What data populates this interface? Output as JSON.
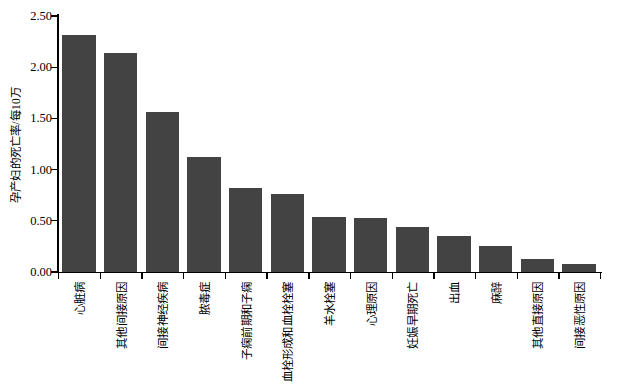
{
  "chart_data": {
    "type": "bar",
    "title": "",
    "subtitle": "",
    "xlabel": "",
    "ylabel": "孕产妇的死亡率/每10万",
    "ylim": [
      0.0,
      2.5
    ],
    "yticks": [
      "0.00",
      "0.50",
      "1.00",
      "1.50",
      "2.00",
      "2.50"
    ],
    "ytick_values": [
      0.0,
      0.5,
      1.0,
      1.5,
      2.0,
      2.5
    ],
    "grid": false,
    "legend": false,
    "legend_position": "none",
    "bar_color": "#434343",
    "axis_color": "#000000",
    "background_color": "#ffffff",
    "categories": [
      "心脏病",
      "其他间接原因",
      "间接神经疾病",
      "脓毒症",
      "子痫前期和子痫",
      "血栓形成和血栓栓塞",
      "羊水栓塞",
      "心理原因",
      "妊娠早期死亡",
      "出血",
      "麻醉",
      "其他直接原因",
      "间接恶性原因"
    ],
    "values": [
      2.31,
      2.14,
      1.56,
      1.12,
      0.82,
      0.76,
      0.54,
      0.53,
      0.44,
      0.35,
      0.25,
      0.13,
      0.08
    ]
  }
}
